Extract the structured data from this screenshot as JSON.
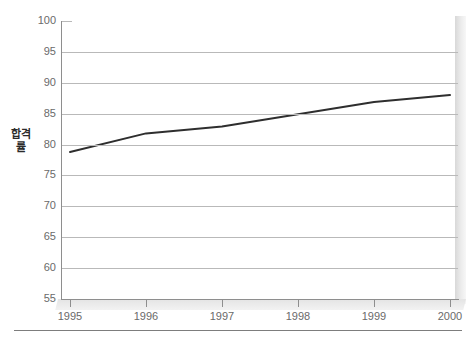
{
  "chart_data": {
    "type": "line",
    "title": "",
    "subtitle": "",
    "xlabel": "",
    "ylabel": "합격률",
    "categories": [
      "1995",
      "1996",
      "1997",
      "1998",
      "1999",
      "2000"
    ],
    "x": [
      1995,
      1996,
      1997,
      1998,
      1999,
      2000
    ],
    "series": [
      {
        "name": "합격률",
        "values": [
          78.8,
          81.8,
          82.9,
          84.9,
          86.9,
          88.0
        ],
        "color": "#2e2e2e"
      }
    ],
    "ylim": [
      55,
      100
    ],
    "ytick_values": [
      55,
      60,
      65,
      70,
      75,
      80,
      85,
      90,
      95,
      100
    ],
    "ytick_labels": [
      "55",
      "60",
      "65",
      "70",
      "75",
      "80",
      "85",
      "90",
      "95",
      "100"
    ],
    "xtick_labels": [
      "1995",
      "1996",
      "1997",
      "1998",
      "1999",
      "2000"
    ],
    "grid": true,
    "grid_axis": "y",
    "grid_color": "#b9b9b9",
    "legend": false,
    "legend_position": "none",
    "annotations": [],
    "style": {
      "background": "#ffffff",
      "axis_color": "#8e8e8e",
      "tick_label_color": "#6a6a6a",
      "axis_title_color": "#2b2b2b",
      "three_d_wall": "#e4e4e4"
    }
  }
}
